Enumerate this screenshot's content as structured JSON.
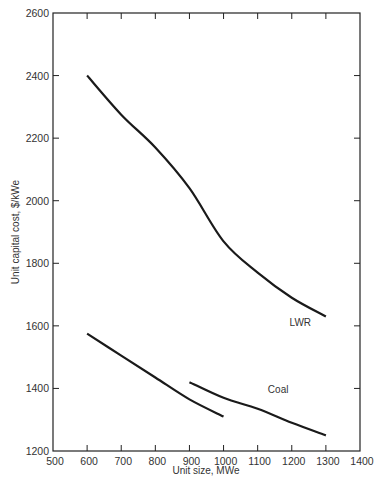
{
  "chart_data": {
    "type": "line",
    "title": "",
    "xlabel": "Unit size, MWe",
    "ylabel": "Unit capital cost, $/kWe",
    "xlim": [
      500,
      1400
    ],
    "ylim": [
      1200,
      2600
    ],
    "xticks": [
      500,
      600,
      700,
      800,
      900,
      1000,
      1100,
      1200,
      1300,
      1400
    ],
    "yticks": [
      1200,
      1400,
      1600,
      1800,
      2000,
      2200,
      2400,
      2600
    ],
    "grid": false,
    "legend": "none (inline curve labels)",
    "series": [
      {
        "name": "LWR",
        "label": "LWR",
        "x": [
          600,
          700,
          800,
          900,
          1000,
          1100,
          1200,
          1300
        ],
        "y": [
          2400,
          2275,
          2170,
          2040,
          1870,
          1770,
          1690,
          1630
        ]
      },
      {
        "name": "Coal (600-1000 MWe)",
        "label": "",
        "x": [
          600,
          700,
          800,
          900,
          1000
        ],
        "y": [
          1575,
          1505,
          1435,
          1365,
          1310
        ]
      },
      {
        "name": "Coal",
        "label": "Coal",
        "x": [
          900,
          1000,
          1100,
          1200,
          1300
        ],
        "y": [
          1420,
          1370,
          1335,
          1290,
          1250
        ]
      }
    ],
    "annotations": [
      {
        "text": "LWR",
        "x": 1225,
        "y": 1600
      },
      {
        "text": "Coal",
        "x": 1160,
        "y": 1385
      }
    ]
  },
  "colors": {
    "line": "#1a1a1a",
    "axis": "#222222",
    "text": "#333333",
    "background": "#ffffff"
  }
}
